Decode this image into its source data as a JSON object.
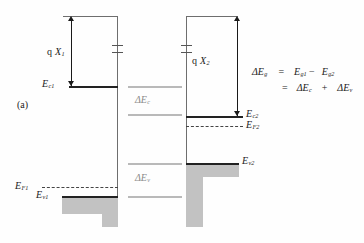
{
  "figure": {
    "caption": "(a)",
    "type": "semiconductor-heterojunction-band-diagram"
  },
  "left_semiconductor": {
    "affinity_label_q": "q",
    "affinity_label_chi": "X",
    "affinity_label_sub": "1",
    "conduction_band_label": "E",
    "conduction_band_sub": "c1",
    "fermi_label": "E",
    "fermi_sub": "F1",
    "valence_band_label": "E",
    "valence_band_sub": "v1"
  },
  "right_semiconductor": {
    "affinity_label_q": "q",
    "affinity_label_chi": "X",
    "affinity_label_sub": "2",
    "conduction_band_label": "E",
    "conduction_band_sub": "c2",
    "fermi_label": "E",
    "fermi_sub": "F2",
    "valence_band_label": "E",
    "valence_band_sub": "v2"
  },
  "offsets": {
    "delta_ec_symbol": "ΔE",
    "delta_ec_sub": "c",
    "delta_ev_symbol": "ΔE",
    "delta_ev_sub": "v"
  },
  "equation": {
    "line1_lhs": "ΔE",
    "line1_lhs_sub": "g",
    "line1_eq": "=",
    "line1_t1": "E",
    "line1_t1_sub": "g1",
    "line1_minus": "−",
    "line1_t2": "E",
    "line1_t2_sub": "g2",
    "line2_eq": "=",
    "line2_t1": "ΔE",
    "line2_t1_sub": "c",
    "line2_plus": "+",
    "line2_t2": "ΔE",
    "line2_t2_sub": "v"
  },
  "colors": {
    "ink": "#1a1a1a",
    "rule": "#6e6e6e",
    "faint_rule": "#b9b9b9",
    "fill_gray": "#c2c2c2",
    "background": "#fefefe"
  }
}
